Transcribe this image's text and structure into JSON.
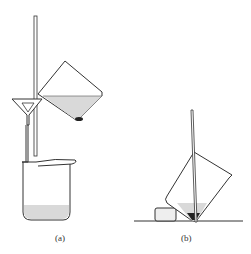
{
  "figure": {
    "labels": {
      "a": "(a)",
      "b": "(b)"
    },
    "colors": {
      "stroke": "#333333",
      "liquid": "#d9d9d9",
      "precipitate": "#222222",
      "background": "#ffffff"
    }
  }
}
